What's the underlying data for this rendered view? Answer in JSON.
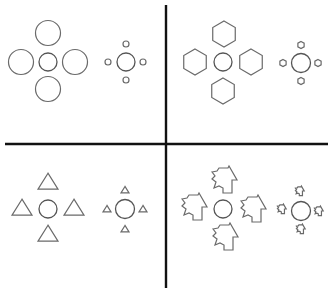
{
  "figure": {
    "width": 332,
    "height": 290,
    "colors": {
      "background": "#ffffff",
      "divider": "#111111",
      "inducer_stroke": "#6a6a6a",
      "target_stroke": "#555555"
    },
    "dividers": {
      "horizontal": {
        "x1": 5,
        "y1": 144,
        "x2": 328,
        "y2": 144
      },
      "vertical": {
        "x1": 166,
        "y1": 5,
        "x2": 166,
        "y2": 288
      }
    },
    "panels": [
      {
        "id": "top-left",
        "inducer_shape": "circle",
        "clusters": [
          {
            "kind": "large-inducers",
            "target": {
              "cx": 48,
              "cy": 62,
              "r": 9
            },
            "inducer_size": 12.5,
            "inducers": [
              {
                "cx": 48,
                "cy": 33
              },
              {
                "cx": 21,
                "cy": 62
              },
              {
                "cx": 75,
                "cy": 62
              },
              {
                "cx": 48,
                "cy": 89
              }
            ]
          },
          {
            "kind": "small-inducers",
            "target": {
              "cx": 126,
              "cy": 62,
              "r": 9
            },
            "inducer_size": 3,
            "inducers": [
              {
                "cx": 126,
                "cy": 44
              },
              {
                "cx": 108,
                "cy": 62
              },
              {
                "cx": 143,
                "cy": 62
              },
              {
                "cx": 126,
                "cy": 80
              }
            ]
          }
        ]
      },
      {
        "id": "top-right",
        "inducer_shape": "hexagon",
        "clusters": [
          {
            "kind": "large-inducers",
            "target": {
              "cx": 223,
              "cy": 62,
              "r": 9
            },
            "inducer_size": 13,
            "inducers": [
              {
                "cx": 224,
                "cy": 34
              },
              {
                "cx": 195,
                "cy": 62
              },
              {
                "cx": 251,
                "cy": 62
              },
              {
                "cx": 223,
                "cy": 91
              }
            ]
          },
          {
            "kind": "small-inducers",
            "target": {
              "cx": 301,
              "cy": 63,
              "r": 9.5
            },
            "inducer_size": 3.6,
            "inducers": [
              {
                "cx": 301,
                "cy": 45
              },
              {
                "cx": 283,
                "cy": 63
              },
              {
                "cx": 318,
                "cy": 63
              },
              {
                "cx": 301,
                "cy": 81
              }
            ]
          }
        ]
      },
      {
        "id": "bottom-left",
        "inducer_shape": "triangle",
        "clusters": [
          {
            "kind": "large-inducers",
            "target": {
              "cx": 48,
              "cy": 209,
              "r": 9
            },
            "inducer_size": 10,
            "inducers": [
              {
                "cx": 48,
                "cy": 182
              },
              {
                "cx": 22,
                "cy": 208
              },
              {
                "cx": 74,
                "cy": 208
              },
              {
                "cx": 48,
                "cy": 234
              }
            ]
          },
          {
            "kind": "small-inducers",
            "target": {
              "cx": 125,
              "cy": 209,
              "r": 9.5
            },
            "inducer_size": 4,
            "inducers": [
              {
                "cx": 125,
                "cy": 190
              },
              {
                "cx": 107,
                "cy": 209
              },
              {
                "cx": 143,
                "cy": 209
              },
              {
                "cx": 125,
                "cy": 229
              }
            ]
          }
        ]
      },
      {
        "id": "bottom-right",
        "inducer_shape": "irregular-leaf",
        "clusters": [
          {
            "kind": "large-inducers",
            "target": {
              "cx": 223,
              "cy": 209,
              "r": 9
            },
            "inducer_size": 1,
            "inducers": [
              {
                "cx": 225,
                "cy": 180
              },
              {
                "cx": 195,
                "cy": 207
              },
              {
                "cx": 254,
                "cy": 209
              },
              {
                "cx": 226,
                "cy": 237
              }
            ]
          },
          {
            "kind": "small-inducers",
            "target": {
              "cx": 301,
              "cy": 211,
              "r": 9.5
            },
            "inducer_size": 0.35,
            "inducers": [
              {
                "cx": 300,
                "cy": 191
              },
              {
                "cx": 282,
                "cy": 209
              },
              {
                "cx": 319,
                "cy": 211
              },
              {
                "cx": 301,
                "cy": 229
              }
            ]
          }
        ]
      }
    ]
  }
}
